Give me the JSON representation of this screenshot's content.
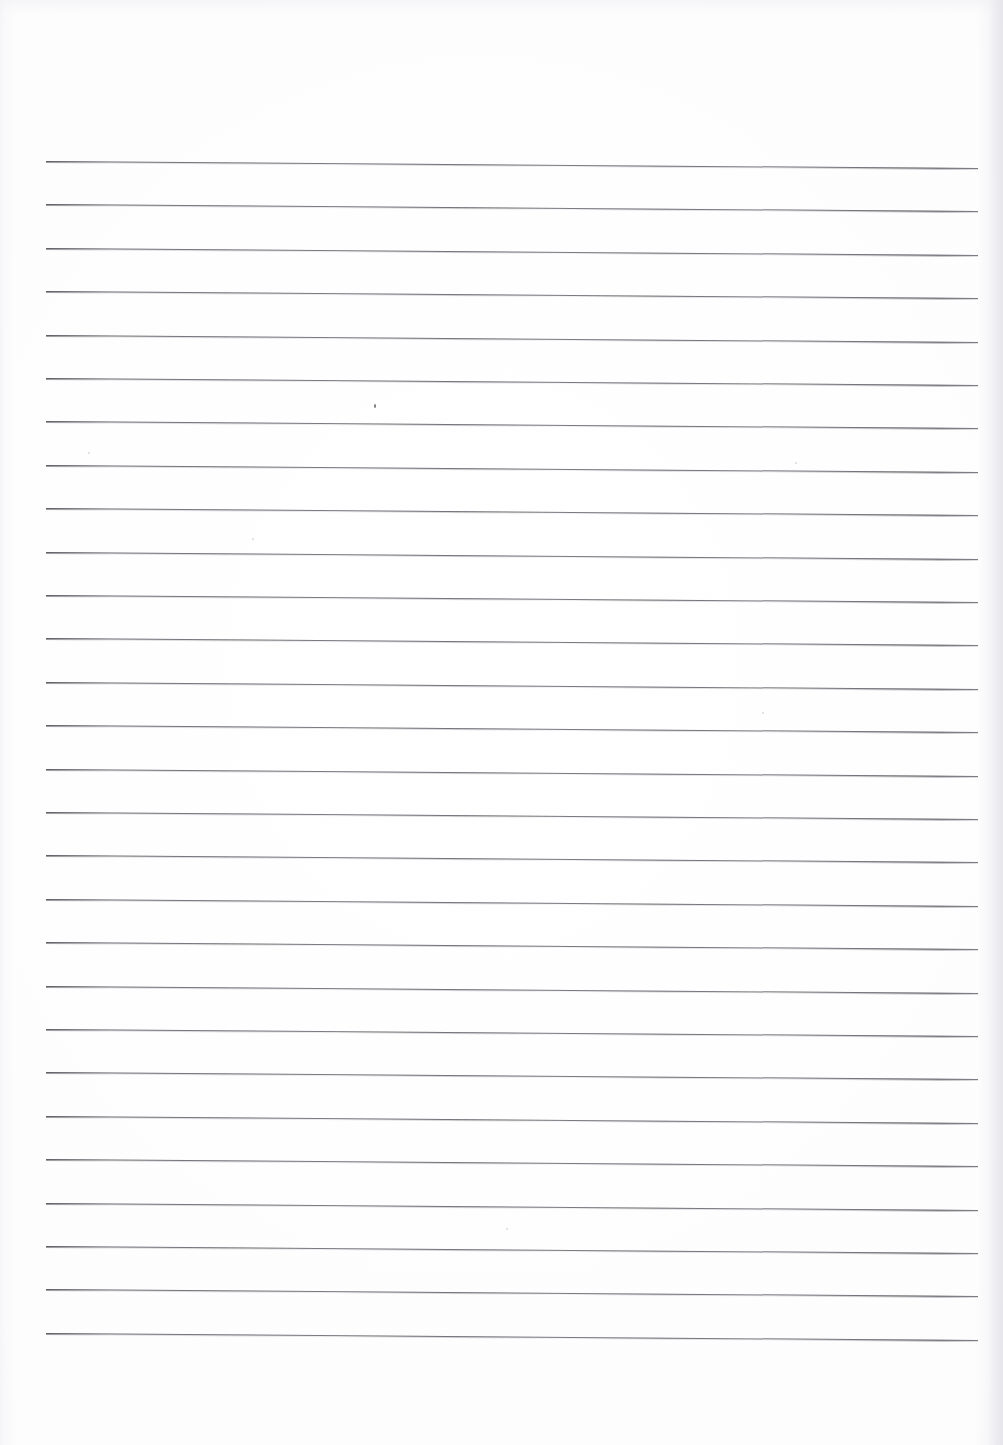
{
  "document": {
    "kind": "scanned-lined-paper",
    "title": "Blank Ruled Notebook Page",
    "page_width": 1003,
    "page_height": 1445,
    "background_color": "#ffffff",
    "rule_color": "#6d6d75",
    "content_text": "",
    "notes": "Empty scanned sheet of ruled writing paper; no handwriting, headings, numbers or other printed marks are present."
  },
  "ruling": {
    "line_count": 28,
    "first_line_y": 161,
    "line_spacing": 43.4,
    "line_start_x": 46,
    "line_end_x": 978,
    "line_thickness": 1.3,
    "skew_degrees": 0.43,
    "margin_rule": "none",
    "header_rule": "none"
  },
  "artifacts": {
    "specks": [
      {
        "x": 374,
        "y": 404,
        "w": 2.4,
        "h": 4.2
      },
      {
        "x": 795,
        "y": 462,
        "w": 2.0,
        "h": 2.0
      },
      {
        "x": 252,
        "y": 538,
        "w": 1.8,
        "h": 1.8
      },
      {
        "x": 762,
        "y": 712,
        "w": 2.0,
        "h": 2.0
      },
      {
        "x": 506,
        "y": 1228,
        "w": 1.8,
        "h": 1.8
      },
      {
        "x": 88,
        "y": 452,
        "w": 1.8,
        "h": 1.8
      }
    ],
    "edge_shadow_side": "right"
  },
  "lines": [
    {
      "index": 1,
      "y": 161.0
    },
    {
      "index": 2,
      "y": 204.4
    },
    {
      "index": 3,
      "y": 247.8
    },
    {
      "index": 4,
      "y": 291.2
    },
    {
      "index": 5,
      "y": 334.6
    },
    {
      "index": 6,
      "y": 378.0
    },
    {
      "index": 7,
      "y": 421.4
    },
    {
      "index": 8,
      "y": 464.8
    },
    {
      "index": 9,
      "y": 508.2
    },
    {
      "index": 10,
      "y": 551.6
    },
    {
      "index": 11,
      "y": 595.0
    },
    {
      "index": 12,
      "y": 638.4
    },
    {
      "index": 13,
      "y": 681.8
    },
    {
      "index": 14,
      "y": 725.2
    },
    {
      "index": 15,
      "y": 768.6
    },
    {
      "index": 16,
      "y": 812.0
    },
    {
      "index": 17,
      "y": 855.4
    },
    {
      "index": 18,
      "y": 898.8
    },
    {
      "index": 19,
      "y": 942.2
    },
    {
      "index": 20,
      "y": 985.6
    },
    {
      "index": 21,
      "y": 1029.0
    },
    {
      "index": 22,
      "y": 1072.4
    },
    {
      "index": 23,
      "y": 1115.8
    },
    {
      "index": 24,
      "y": 1159.2
    },
    {
      "index": 25,
      "y": 1202.6
    },
    {
      "index": 26,
      "y": 1246.0
    },
    {
      "index": 27,
      "y": 1289.4
    },
    {
      "index": 28,
      "y": 1332.8
    }
  ]
}
